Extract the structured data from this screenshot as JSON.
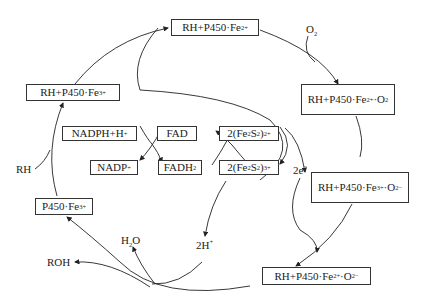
{
  "diagram": {
    "states": {
      "rh_fe3": {
        "base": "RH+P450·Fe",
        "sup": "3+"
      },
      "rh_fe2": {
        "base": "RH+P450·Fe",
        "sup": "2+"
      },
      "rh_fe2_o2": {
        "base": "RH+P450·Fe",
        "sup": "2+",
        "tail": "·O",
        "sub": "2"
      },
      "rh_fe3_o2m": {
        "base": "RH+P450·Fe",
        "sup": "3+",
        "tail": "·O",
        "sub": "2",
        "sup2": "−"
      },
      "rh_fe2_o2m": {
        "base": "RH+P450·Fe",
        "sup": "2+",
        "tail": "·O",
        "sub": "2",
        "sup2": "−"
      },
      "p450_fe3": {
        "base": "P450·Fe",
        "sup": "3+"
      }
    },
    "electron_chain": {
      "nadph": {
        "base": "NADPH+H",
        "sup": "+"
      },
      "nadp": {
        "base": "NADP",
        "sup": "+"
      },
      "fad": {
        "base": "FAD"
      },
      "fadh2": {
        "base": "FADH",
        "sub": "2"
      },
      "fes_red": {
        "pre": "2(Fe",
        "sub1": "2",
        "mid": "S",
        "sub2": "2",
        "post": ")",
        "sup": "2+"
      },
      "fes_ox": {
        "pre": "2(Fe",
        "sub1": "2",
        "mid": "S",
        "sub2": "2",
        "post": ")",
        "sup": "3+"
      }
    },
    "species": {
      "o2": {
        "base": "O",
        "sub": "2"
      },
      "rh": {
        "base": "RH"
      },
      "electrons": {
        "base": "2e",
        "sup": "−"
      },
      "protons": {
        "base": "2H",
        "sup": "+"
      },
      "water": {
        "pre": "H",
        "sub": "2",
        "post": "O"
      },
      "roh": {
        "base": "ROH"
      }
    }
  }
}
